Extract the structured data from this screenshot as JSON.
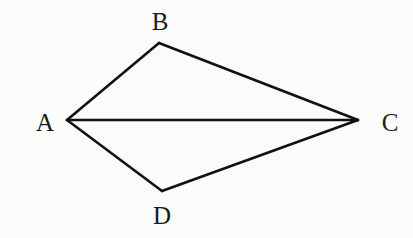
{
  "diagram": {
    "type": "quadrilateral-kite-with-diagonal",
    "background": "#fbfbf9",
    "stroke_color": "#111111",
    "points": {
      "A": {
        "x": 67,
        "y": 120,
        "label": "A",
        "lx": 45,
        "ly": 131
      },
      "B": {
        "x": 159,
        "y": 43,
        "label": "B",
        "lx": 160,
        "ly": 30
      },
      "C": {
        "x": 358,
        "y": 120,
        "label": "C",
        "lx": 390,
        "ly": 131
      },
      "D": {
        "x": 162,
        "y": 191,
        "label": "D",
        "lx": 162,
        "ly": 224
      }
    },
    "edges": [
      {
        "from": "A",
        "to": "B"
      },
      {
        "from": "B",
        "to": "C"
      },
      {
        "from": "C",
        "to": "D"
      },
      {
        "from": "D",
        "to": "A"
      },
      {
        "from": "A",
        "to": "C"
      }
    ]
  }
}
